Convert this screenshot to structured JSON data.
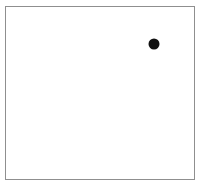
{
  "figure": {
    "type": "scatter-panel",
    "width": 202,
    "height": 186,
    "background_color": "#ffffff"
  },
  "panel": {
    "name": "plot-frame",
    "border_color": "#8f8f8f",
    "border_width_px": 1,
    "fill_color": "#ffffff",
    "left_px": 5,
    "top_px": 6,
    "width_px": 190,
    "height_px": 174
  },
  "chart_data": {
    "type": "scatter",
    "title": "",
    "subtitle": "",
    "xlabel": "",
    "ylabel": "",
    "grid": false,
    "legend": null,
    "axis_ticks": [],
    "tick_labels": [],
    "annotations": [],
    "xlim": [
      0,
      1
    ],
    "ylim": [
      0,
      1
    ],
    "marker": {
      "shape": "circle",
      "color": "#111111",
      "filled": true,
      "diameter_px": 11
    },
    "points": [
      {
        "label": "",
        "x": 0.776,
        "y": 0.79,
        "px_x": 152.5,
        "px_y": 42.5
      }
    ]
  }
}
